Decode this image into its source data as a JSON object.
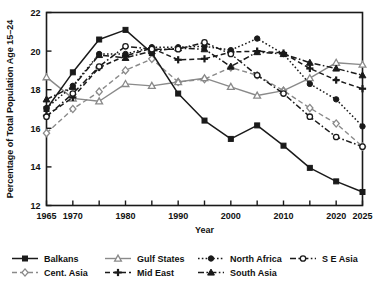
{
  "chart_data": {
    "type": "line",
    "title": "",
    "xlabel": "Year",
    "ylabel": "Percentage of Total Population Age 15–24",
    "xlim": [
      1965,
      2025
    ],
    "ylim": [
      12,
      22
    ],
    "ytick_labels": [
      "12",
      "14",
      "16",
      "18",
      "20",
      "22"
    ],
    "yticks": [
      12,
      14,
      16,
      18,
      20,
      22
    ],
    "xticks": [
      1965,
      1970,
      1975,
      1980,
      1985,
      1990,
      1995,
      2000,
      2005,
      2010,
      2015,
      2020,
      2025
    ],
    "xtick_labels": [
      "1965",
      "1970",
      "",
      "1980",
      "",
      "1990",
      "",
      "2000",
      "",
      "2010",
      "",
      "2020",
      "2025"
    ],
    "grid": false,
    "legend_position": "bottom",
    "x": [
      1965,
      1970,
      1975,
      1980,
      1985,
      1990,
      1995,
      2000,
      2005,
      2010,
      2015,
      2020,
      2025
    ],
    "series": [
      {
        "name": "Balkans",
        "color": "#1a1a1a",
        "dash": "none",
        "marker": "filled-square",
        "values": [
          17.0,
          18.9,
          20.6,
          21.1,
          19.9,
          17.8,
          16.4,
          15.45,
          16.15,
          15.1,
          13.95,
          13.25,
          12.7
        ]
      },
      {
        "name": "Cent. Asia",
        "color": "#8a8a8a",
        "dash": "dashed",
        "marker": "open-diamond",
        "values": [
          15.75,
          17.0,
          17.9,
          19.0,
          19.6,
          18.4,
          18.55,
          19.15,
          18.75,
          17.95,
          17.05,
          16.25,
          15.05
        ]
      },
      {
        "name": "Gulf States",
        "color": "#8a8a8a",
        "dash": "none",
        "marker": "open-triangle",
        "values": [
          18.65,
          17.55,
          17.4,
          18.3,
          18.2,
          18.4,
          18.6,
          18.15,
          17.7,
          17.95,
          18.6,
          19.4,
          19.3
        ]
      },
      {
        "name": "Mid East",
        "color": "#1a1a1a",
        "dash": "dashed",
        "marker": "filled-plus",
        "values": [
          16.65,
          17.6,
          19.15,
          19.75,
          20.15,
          19.55,
          19.6,
          19.95,
          20.0,
          19.9,
          19.1,
          18.5,
          18.05
        ]
      },
      {
        "name": "North Africa",
        "color": "#1a1a1a",
        "dash": "dotted",
        "marker": "filled-circle",
        "values": [
          17.05,
          18.2,
          19.85,
          19.85,
          20.2,
          20.2,
          20.25,
          20.05,
          20.65,
          19.85,
          18.3,
          17.5,
          16.1
        ]
      },
      {
        "name": "South Asia",
        "color": "#1a1a1a",
        "dash": "dashdot",
        "marker": "filled-triangle",
        "values": [
          17.5,
          18.15,
          19.8,
          19.65,
          20.0,
          20.15,
          20.1,
          19.2,
          19.95,
          19.85,
          19.4,
          19.1,
          18.75
        ]
      },
      {
        "name": "S E Asia",
        "color": "#1a1a1a",
        "dash": "dashdot",
        "marker": "open-circle",
        "values": [
          16.6,
          17.8,
          19.2,
          20.25,
          20.1,
          20.1,
          20.45,
          19.85,
          18.75,
          17.8,
          16.6,
          15.55,
          15.05
        ]
      }
    ]
  },
  "legend": {
    "entries": [
      {
        "label": "Balkans"
      },
      {
        "label": "Gulf States"
      },
      {
        "label": "North Africa"
      },
      {
        "label": "S E Asia"
      },
      {
        "label": "Cent. Asia"
      },
      {
        "label": "Mid East"
      },
      {
        "label": "South Asia"
      }
    ]
  }
}
